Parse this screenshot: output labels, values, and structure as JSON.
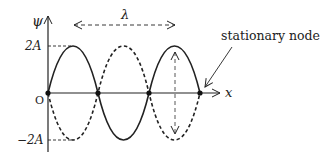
{
  "diagram": {
    "axes": {
      "y_label": "ψ",
      "x_label": "x",
      "origin_label": "O",
      "y_ticks": [
        {
          "label": "2A",
          "value": 2
        },
        {
          "label": "−2A",
          "value": -2
        }
      ]
    },
    "wavelength_label": "λ",
    "annotation": "stationary node",
    "nodes_x": [
      48,
      98,
      149,
      200
    ],
    "colors": {
      "stroke": "#222222",
      "background": "#ffffff"
    },
    "curves": [
      {
        "name": "solid",
        "style": "solid",
        "description": "2A sin(kx)"
      },
      {
        "name": "dashed",
        "style": "dashed",
        "description": "-2A sin(kx)"
      }
    ]
  }
}
